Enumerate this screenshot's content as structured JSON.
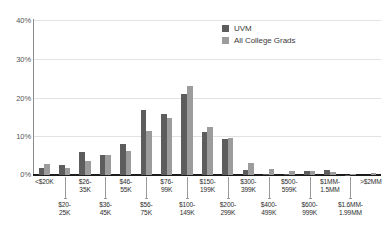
{
  "chart_data": {
    "type": "bar",
    "title": "",
    "xlabel": "",
    "ylabel": "",
    "ylim": [
      0,
      40
    ],
    "grid": true,
    "legend_position": "top-right",
    "ytick_labels": [
      "40%",
      "30%",
      "20%",
      "10%",
      "0%"
    ],
    "ytick_values": [
      40,
      30,
      20,
      10,
      0
    ],
    "categories": [
      "<$20K",
      "$20-\n25K",
      "$26-\n35K",
      "$36-\n45K",
      "$46-\n55K",
      "$56-\n75K",
      "$76-\n99K",
      "$100-\n149K",
      "$150-\n199K",
      "$200-\n299K",
      "$300-\n399K",
      "$400-\n499K",
      "$500-\n599K",
      "$600-\n999K",
      "$1MM-\n1.5MM",
      "$1.6MM-\n1.99MM",
      ">$2MM"
    ],
    "category_labels": [
      {
        "line1": "<$20K",
        "line2": "",
        "row": "top"
      },
      {
        "line1": "$20-",
        "line2": "25K",
        "row": "bottom"
      },
      {
        "line1": "$26-",
        "line2": "35K",
        "row": "top"
      },
      {
        "line1": "$36-",
        "line2": "45K",
        "row": "bottom"
      },
      {
        "line1": "$46-",
        "line2": "55K",
        "row": "top"
      },
      {
        "line1": "$56-",
        "line2": "75K",
        "row": "bottom"
      },
      {
        "line1": "$76-",
        "line2": "99K",
        "row": "top"
      },
      {
        "line1": "$100-",
        "line2": "149K",
        "row": "bottom"
      },
      {
        "line1": "$150-",
        "line2": "199K",
        "row": "top"
      },
      {
        "line1": "$200-",
        "line2": "299K",
        "row": "bottom"
      },
      {
        "line1": "$300-",
        "line2": "399K",
        "row": "top"
      },
      {
        "line1": "$400-",
        "line2": "499K",
        "row": "bottom"
      },
      {
        "line1": "$500-",
        "line2": "599K",
        "row": "top"
      },
      {
        "line1": "$600-",
        "line2": "999K",
        "row": "bottom"
      },
      {
        "line1": "$1MM-",
        "line2": "1.5MM",
        "row": "top"
      },
      {
        "line1": "$1.6MM-",
        "line2": "1.99MM",
        "row": "bottom"
      },
      {
        "line1": ">$2MM",
        "line2": "",
        "row": "top"
      }
    ],
    "series": [
      {
        "name": "UVM",
        "color": "#5d5d5d",
        "values": [
          1.8,
          2.7,
          5.9,
          5.1,
          7.9,
          16.8,
          15.8,
          21.0,
          11.0,
          9.2,
          1.2,
          0.2,
          0.3,
          1.1,
          1.3,
          0.1,
          0.0
        ]
      },
      {
        "name": "All College Grads",
        "color": "#9c9c9c",
        "values": [
          2.9,
          1.8,
          3.7,
          5.1,
          6.1,
          11.3,
          14.7,
          22.9,
          12.4,
          9.6,
          3.0,
          1.5,
          1.0,
          1.0,
          0.7,
          0.3,
          0.4
        ]
      }
    ]
  },
  "legend": {
    "items": [
      {
        "label": "UVM",
        "color": "#5d5d5d"
      },
      {
        "label": "All College Grads",
        "color": "#9c9c9c"
      }
    ]
  }
}
